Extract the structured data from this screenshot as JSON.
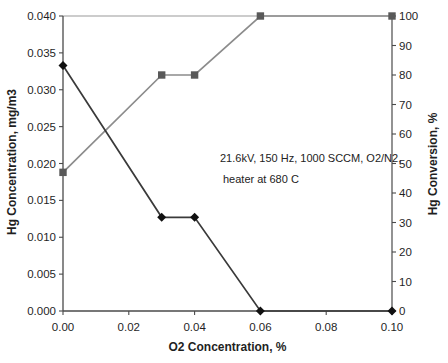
{
  "chart_data": {
    "type": "line",
    "title": "",
    "xlabel": "O2 Concentration, %",
    "ylabel_left": "Hg Concentration, mg/m3",
    "ylabel_right": "Hg Conversion, %",
    "xlim": [
      0,
      0.1
    ],
    "ylim_left": [
      0,
      0.04
    ],
    "ylim_right": [
      0,
      100
    ],
    "x_ticks": [
      "0.00",
      "0.02",
      "0.04",
      "0.06",
      "0.08",
      "0.10"
    ],
    "left_ticks": [
      "0.040",
      "0.035",
      "0.030",
      "0.025",
      "0.020",
      "0.015",
      "0.010",
      "0.005",
      "0.000"
    ],
    "right_ticks": [
      "100",
      "90",
      "80",
      "70",
      "60",
      "50",
      "40",
      "30",
      "20",
      "10",
      "0"
    ],
    "grid": "top-border-only",
    "legend": "none",
    "series": [
      {
        "name": "Hg Concentration",
        "axis": "left",
        "marker": "diamond",
        "marker_color": "#111111",
        "line_color": "#3a3a3a",
        "x": [
          0.0,
          0.03,
          0.04,
          0.06,
          0.1
        ],
        "y": [
          0.0333,
          0.0127,
          0.0127,
          0.0,
          0.0
        ]
      },
      {
        "name": "Hg Conversion",
        "axis": "right",
        "marker": "square",
        "marker_color": "#595959",
        "line_color": "#8c8c8c",
        "x": [
          0.0,
          0.03,
          0.04,
          0.06,
          0.1
        ],
        "y": [
          47,
          80,
          80,
          100,
          100
        ]
      }
    ],
    "annotation": {
      "line1": "21.6kV, 150 Hz, 1000 SCCM, O2/N2,",
      "line2": "heater at 680 C"
    }
  },
  "colors": {
    "background": "#ffffff",
    "axis": "#4a4a4a",
    "gridline": "#9a9a9a",
    "tick_text": "#1f1f1f"
  }
}
